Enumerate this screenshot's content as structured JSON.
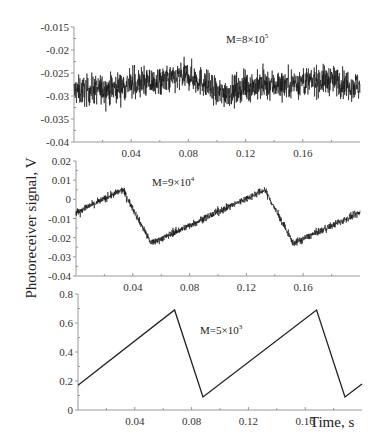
{
  "ylabel": "Photoreceiver signal, V",
  "xlabel": "Time, s",
  "chart_data": [
    {
      "type": "line",
      "title": "",
      "annotation": "M=8×10^5",
      "annotation_base": "M=8×10",
      "annotation_exp": "5",
      "xlabel": "",
      "ylabel": "Photoreceiver signal, V",
      "xlim": [
        0,
        0.2
      ],
      "ylim": [
        -0.04,
        -0.015
      ],
      "xticks": [
        0.04,
        0.08,
        0.12,
        0.16
      ],
      "xtick_labels": [
        "0.04",
        "0.08",
        "0.12",
        "0.16"
      ],
      "yticks": [
        -0.015,
        -0.02,
        -0.025,
        -0.03,
        -0.035,
        -0.04
      ],
      "ytick_labels": [
        "-0.015",
        "-0.02",
        "-0.025",
        "-0.03",
        "-0.035",
        "-0.04"
      ],
      "grid": false,
      "noise_amplitude": 0.0035,
      "x": [
        0,
        0.02,
        0.04,
        0.06,
        0.08,
        0.09,
        0.1,
        0.11,
        0.12,
        0.14,
        0.16,
        0.18,
        0.2
      ],
      "y": [
        -0.029,
        -0.0285,
        -0.0275,
        -0.027,
        -0.0255,
        -0.027,
        -0.0295,
        -0.029,
        -0.028,
        -0.0275,
        -0.027,
        -0.0265,
        -0.028
      ]
    },
    {
      "type": "line",
      "title": "",
      "annotation": "M=9×10^4",
      "annotation_base": "M=9×10",
      "annotation_exp": "4",
      "xlabel": "",
      "ylabel": "",
      "xlim": [
        0,
        0.2
      ],
      "ylim": [
        -0.04,
        0.02
      ],
      "xticks": [
        0.04,
        0.08,
        0.12,
        0.16
      ],
      "xtick_labels": [
        "0.04",
        "0.08",
        "0.12",
        "0.16"
      ],
      "yticks": [
        0.02,
        0.01,
        0,
        -0.01,
        -0.02,
        -0.03,
        -0.04
      ],
      "ytick_labels": [
        "0.02",
        "0.01",
        "0",
        "-0.01",
        "-0.02",
        "-0.03",
        "-0.04"
      ],
      "grid": false,
      "noise_amplitude": 0.002,
      "x": [
        0,
        0.033,
        0.053,
        0.133,
        0.153,
        0.2
      ],
      "y": [
        -0.007,
        0.005,
        -0.023,
        0.005,
        -0.023,
        -0.007
      ]
    },
    {
      "type": "line",
      "title": "",
      "annotation": "M=5×10^3",
      "annotation_base": "M=5×10",
      "annotation_exp": "3",
      "xlabel": "Time, s",
      "ylabel": "",
      "xlim": [
        0,
        0.2
      ],
      "ylim": [
        0,
        0.8
      ],
      "xticks": [
        0.04,
        0.08,
        0.12,
        0.16
      ],
      "xtick_labels": [
        "0.04",
        "0.08",
        "0.12",
        "0.16"
      ],
      "yticks": [
        0.8,
        0.6,
        0.4,
        0.2,
        0
      ],
      "ytick_labels": [
        "0.8",
        "0.6",
        "0.4",
        "0.2",
        "0"
      ],
      "grid": false,
      "noise_amplitude": 0,
      "x": [
        0,
        0.068,
        0.088,
        0.168,
        0.188,
        0.2
      ],
      "y": [
        0.17,
        0.69,
        0.09,
        0.69,
        0.09,
        0.18
      ]
    }
  ]
}
